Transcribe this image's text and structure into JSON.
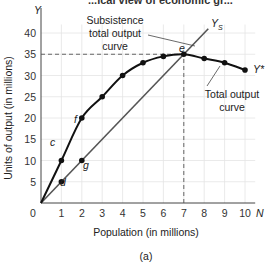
{
  "header_partial": "...ical view of economic gr...",
  "chart_data": {
    "type": "line",
    "title": "",
    "caption": "(a)",
    "xlabel": "Population (in millions)",
    "ylabel": "Units of output (in millions)",
    "x_axis_symbol": "N",
    "y_axis_symbol": "Y",
    "xlim": [
      0,
      10
    ],
    "ylim": [
      0,
      40
    ],
    "x_ticks": [
      0,
      1,
      2,
      3,
      4,
      5,
      6,
      7,
      8,
      9,
      10
    ],
    "y_ticks": [
      5,
      10,
      15,
      20,
      25,
      30,
      35,
      40
    ],
    "grid": true,
    "series": [
      {
        "name": "Total output curve",
        "end_label": "Y*",
        "x": [
          0,
          1,
          2,
          3,
          4,
          5,
          6,
          7,
          8,
          9,
          10
        ],
        "values": [
          0,
          10,
          20,
          25,
          30,
          33,
          34.5,
          35,
          34,
          33,
          31.3
        ],
        "color": "#111111"
      },
      {
        "name": "Subsistence total output curve",
        "end_label": "YS",
        "x": [
          0,
          1,
          2,
          7,
          8.2
        ],
        "values": [
          0,
          5,
          10,
          35,
          41
        ],
        "color": "#555555"
      }
    ],
    "points": [
      {
        "label": "c",
        "x": 1,
        "y": 10
      },
      {
        "label": "f",
        "x": 2,
        "y": 20
      },
      {
        "label": "d",
        "x": 1,
        "y": 5
      },
      {
        "label": "g",
        "x": 2,
        "y": 10
      },
      {
        "label": "e",
        "x": 7,
        "y": 35
      }
    ],
    "reference_lines": [
      {
        "type": "horizontal",
        "y": 35,
        "style": "dashed",
        "from_x": 0,
        "to_x": 7
      },
      {
        "type": "vertical",
        "x": 7,
        "style": "dashed",
        "from_y": 0,
        "to_y": 35
      }
    ],
    "annotations": [
      "Subsistence total output curve",
      "Total output curve"
    ]
  },
  "labels": {
    "subsistence_line1": "Subsistence",
    "subsistence_line2": "total output",
    "subsistence_line3": "curve",
    "total_line1": "Total output",
    "total_line2": "curve",
    "ys": "Y",
    "ys_sub": "S",
    "ystar": "Y*",
    "y_axis": "Y",
    "n_axis": "N",
    "xlabel": "Population (in millions)",
    "ylabel": "Units of output (in millions)",
    "caption": "(a)",
    "zero": "0",
    "pt_c": "c",
    "pt_f": "f",
    "pt_d": "d",
    "pt_g": "g",
    "pt_e": "e"
  }
}
